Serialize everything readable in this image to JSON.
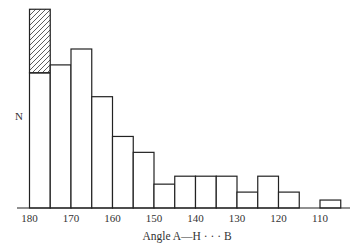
{
  "chart_data": {
    "type": "bar",
    "title": "",
    "xlabel": "Angle A—H · · · B",
    "ylabel": "N",
    "x_direction": "descending",
    "bin_width": 5,
    "bin_edges": [
      180,
      175,
      170,
      165,
      160,
      155,
      150,
      145,
      140,
      135,
      130,
      125,
      120,
      115,
      110,
      105
    ],
    "tick_labels": [
      "180",
      "170",
      "160",
      "150",
      "140",
      "130",
      "120",
      "110"
    ],
    "tick_values": [
      180,
      170,
      160,
      150,
      140,
      130,
      120,
      110
    ],
    "categories": [
      "180-175",
      "175-170",
      "170-165",
      "165-160",
      "160-155",
      "155-150",
      "150-145",
      "145-140",
      "140-135",
      "135-130",
      "130-125",
      "125-120",
      "120-115",
      "115-110",
      "110-105"
    ],
    "series": [
      {
        "name": "plain",
        "style": "open",
        "values": [
          17,
          18,
          20,
          14,
          9,
          7,
          3,
          4,
          4,
          4,
          2,
          4,
          2,
          0,
          1
        ]
      },
      {
        "name": "hatched",
        "style": "hatched",
        "stacked_on": "plain",
        "values": [
          8,
          0,
          0,
          0,
          0,
          0,
          0,
          0,
          0,
          0,
          0,
          0,
          0,
          0,
          0
        ]
      }
    ],
    "grid": false,
    "legend": "none",
    "ylim": [
      0,
      25
    ],
    "yticks_shown": false
  }
}
